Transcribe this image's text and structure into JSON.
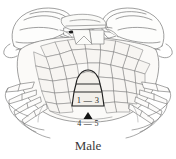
{
  "figure": {
    "caption": "Male",
    "background_color": "#ffffff",
    "line_color": "#6b6b6b",
    "ink_color": "#2a2a2a",
    "fill_color": "#f4f2ef",
    "width": 176,
    "height": 159
  },
  "labels": {
    "abdomen_segments_upper": "1 — 3",
    "abdomen_segments_lower": "4 — 5",
    "pointer_marker": "filled-triangle"
  },
  "anatomy": {
    "view": "ventral",
    "abdomen_shape": "narrow triangular",
    "parts": [
      "carapace",
      "left-chela",
      "right-chela",
      "walking-legs-left",
      "walking-legs-right",
      "sternum-plates",
      "abdomen-flap",
      "maxillipeds"
    ]
  }
}
